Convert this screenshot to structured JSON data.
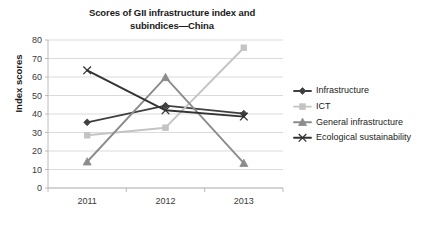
{
  "chart_data": {
    "type": "line",
    "title": "Scores of GII infrastructure index and subindices—China",
    "title_line1": "Scores of GII infrastructure index and",
    "title_line2": "subindices—China",
    "xlabel": "",
    "ylabel": "Index scores",
    "categories": [
      "2011",
      "2012",
      "2013"
    ],
    "x": [
      2011,
      2012,
      2013
    ],
    "ylim": [
      0,
      80
    ],
    "ytick_step": 10,
    "yticks": [
      "0",
      "10",
      "20",
      "30",
      "40",
      "50",
      "60",
      "70",
      "80"
    ],
    "grid": true,
    "legend_position": "right",
    "series": [
      {
        "name": "Infrastructure",
        "values": [
          35.5,
          44.5,
          40.2
        ],
        "color": "#404040",
        "marker": "diamond"
      },
      {
        "name": "ICT",
        "values": [
          28.5,
          32.6,
          75.8
        ],
        "color": "#c4c4c4",
        "marker": "square"
      },
      {
        "name": "General infrastructure",
        "values": [
          14.2,
          59.8,
          13.4
        ],
        "color": "#8c8c8c",
        "marker": "triangle"
      },
      {
        "name": "Ecological sustainability",
        "values": [
          63.6,
          42.0,
          38.6
        ],
        "color": "#333333",
        "marker": "cross"
      }
    ]
  },
  "legend": {
    "items": [
      {
        "label": "Infrastructure"
      },
      {
        "label": "ICT"
      },
      {
        "label": "General infrastructure"
      },
      {
        "label": "Ecological sustainability"
      }
    ]
  }
}
